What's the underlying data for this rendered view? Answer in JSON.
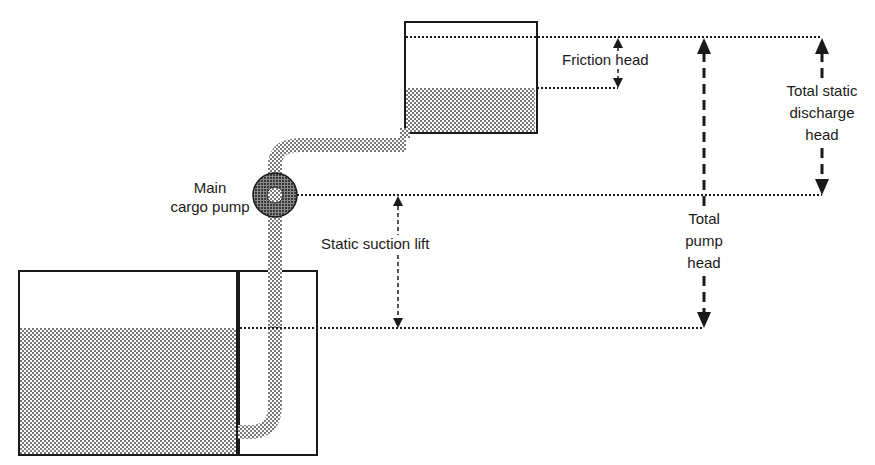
{
  "colors": {
    "ink": "#1a1a1a",
    "liquid_dot": "#444444",
    "background": "#ffffff"
  },
  "labels": {
    "friction_head": "Friction head",
    "total_static_discharge_head": [
      "Total static",
      "discharge",
      "head"
    ],
    "main_cargo_pump": [
      "Main",
      "cargo pump"
    ],
    "static_suction_lift": "Static suction lift",
    "total_pump_head": [
      "Total",
      "pump",
      "head"
    ]
  },
  "components": {
    "upper_tank": "Discharge tank (partially filled)",
    "lower_tank": "Cargo tank with partition (partially filled)",
    "pump": "Main cargo pump",
    "pipe": "Suction and discharge pipeline"
  }
}
